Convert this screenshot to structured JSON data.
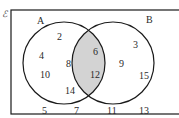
{
  "diagram": {
    "type": "venn",
    "universal_label": "ℰ",
    "sets": [
      {
        "name": "A",
        "label": "A"
      },
      {
        "name": "B",
        "label": "B"
      }
    ],
    "shaded_region": "A ∩ B",
    "colors": {
      "outline": "#1a1a1a",
      "shade": "#d3d3d3",
      "background": "#ffffff",
      "text": "#2a2a2a"
    },
    "regions": {
      "A_only": [
        "2",
        "4",
        "8",
        "10",
        "14"
      ],
      "A_and_B": [
        "6",
        "12"
      ],
      "B_only": [
        "3",
        "9",
        "15"
      ],
      "outside": [
        "5",
        "7",
        "11",
        "13"
      ]
    },
    "labels": {
      "a_only_0": "2",
      "a_only_1": "4",
      "a_only_2": "8",
      "a_only_3": "10",
      "a_only_4": "14",
      "both_0": "6",
      "both_1": "12",
      "b_only_0": "3",
      "b_only_1": "9",
      "b_only_2": "15",
      "out_0": "5",
      "out_1": "7",
      "out_2": "11",
      "out_3": "13"
    }
  }
}
